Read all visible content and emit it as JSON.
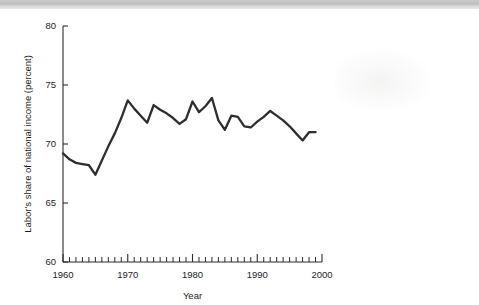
{
  "page": {
    "background_color": "#ffffff",
    "top_band_color": "#c2c4c6"
  },
  "chart_data": {
    "type": "line",
    "title": "",
    "subtitle": "",
    "xlabel": "Year",
    "ylabel": "Labor's share of national income (percent)",
    "xlim": [
      1960,
      2000
    ],
    "ylim": [
      60,
      80
    ],
    "grid": false,
    "legend": null,
    "legend_position": "none",
    "x_major_ticks": [
      1960,
      1970,
      1980,
      1990,
      2000
    ],
    "x_major_tick_labels": [
      "1960",
      "1970",
      "1980",
      "1990",
      "2000"
    ],
    "x_minor_tick_step": 1,
    "y_major_ticks": [
      60,
      65,
      70,
      75,
      80
    ],
    "y_major_tick_labels": [
      "60",
      "65",
      "70",
      "75",
      "80"
    ],
    "line_color": "#2e2e30",
    "line_width": 2.3,
    "annotations": [],
    "series": [
      {
        "name": "Labor's share of national income",
        "x": [
          1960,
          1961,
          1962,
          1963,
          1964,
          1965,
          1966,
          1967,
          1968,
          1969,
          1970,
          1971,
          1972,
          1973,
          1974,
          1975,
          1976,
          1977,
          1978,
          1979,
          1980,
          1981,
          1982,
          1983,
          1984,
          1985,
          1986,
          1987,
          1988,
          1989,
          1990,
          1991,
          1992,
          1993,
          1994,
          1995,
          1996,
          1997,
          1998,
          1999
        ],
        "values": [
          69.2,
          68.7,
          68.4,
          68.3,
          68.2,
          67.4,
          68.6,
          69.8,
          70.9,
          72.2,
          73.7,
          73.0,
          72.4,
          71.8,
          73.3,
          72.9,
          72.6,
          72.2,
          71.7,
          72.1,
          73.6,
          72.7,
          73.2,
          73.9,
          72.0,
          71.2,
          72.4,
          72.3,
          71.5,
          71.4,
          71.9,
          72.3,
          72.8,
          72.4,
          72.0,
          71.5,
          70.9,
          70.3,
          71.0,
          71.0
        ]
      }
    ]
  }
}
